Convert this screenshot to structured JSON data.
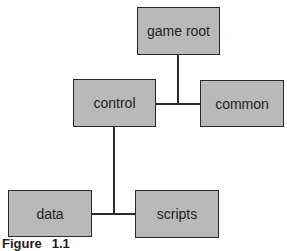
{
  "diagram": {
    "type": "tree",
    "nodes": [
      {
        "id": "game-root",
        "label": "game root"
      },
      {
        "id": "control",
        "label": "control"
      },
      {
        "id": "common",
        "label": "common"
      },
      {
        "id": "data",
        "label": "data"
      },
      {
        "id": "scripts",
        "label": "scripts"
      }
    ],
    "edges": [
      {
        "from": "game-root",
        "to": "control"
      },
      {
        "from": "game-root",
        "to": "common"
      },
      {
        "from": "control",
        "to": "data"
      },
      {
        "from": "control",
        "to": "scripts"
      }
    ],
    "colors": {
      "node_fill": "#b9b9b9",
      "node_border": "#2a2a2a",
      "line": "#2a2a2a"
    }
  },
  "caption": {
    "label": "Figure",
    "number": "1.1"
  }
}
